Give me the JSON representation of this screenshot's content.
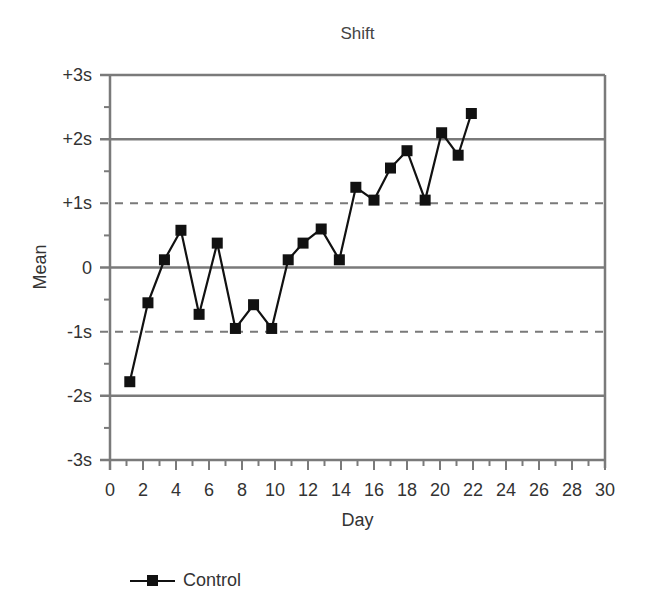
{
  "chart_data": {
    "type": "line",
    "title": "Shift",
    "xlabel": "Day",
    "ylabel": "Mean",
    "xlim": [
      0,
      30
    ],
    "ylim": [
      -3,
      3
    ],
    "x_ticks": [
      "0",
      "2",
      "4",
      "6",
      "8",
      "10",
      "12",
      "14",
      "16",
      "18",
      "20",
      "22",
      "24",
      "26",
      "28",
      "30"
    ],
    "y_ticks": [
      {
        "value": 3,
        "label": "+3s"
      },
      {
        "value": 2,
        "label": "+2s"
      },
      {
        "value": 1,
        "label": "+1s"
      },
      {
        "value": 0,
        "label": "0"
      },
      {
        "value": -1,
        "label": "-1s"
      },
      {
        "value": -2,
        "label": "-2s"
      },
      {
        "value": -3,
        "label": "-3s"
      }
    ],
    "reference_lines": [
      {
        "value": 2,
        "style": "solid"
      },
      {
        "value": 1,
        "style": "dashed"
      },
      {
        "value": 0,
        "style": "solid"
      },
      {
        "value": -1,
        "style": "dashed"
      },
      {
        "value": -2,
        "style": "solid"
      }
    ],
    "series": [
      {
        "name": "Control",
        "marker": "square",
        "x": [
          1.2,
          2.3,
          3.3,
          4.3,
          5.4,
          6.5,
          7.6,
          8.7,
          9.8,
          10.8,
          11.7,
          12.8,
          13.9,
          14.9,
          16.0,
          17.0,
          18.0,
          19.1,
          20.1,
          21.1,
          21.9
        ],
        "values": [
          -1.78,
          -0.55,
          0.12,
          0.58,
          -0.73,
          0.38,
          -0.95,
          -0.58,
          -0.95,
          0.12,
          0.38,
          0.6,
          0.12,
          1.25,
          1.05,
          1.55,
          1.82,
          1.05,
          2.1,
          1.75,
          2.4
        ]
      }
    ],
    "legend": {
      "position": "bottom-left",
      "entries": [
        "Control"
      ]
    },
    "grid": false
  },
  "legend_label": "Control"
}
